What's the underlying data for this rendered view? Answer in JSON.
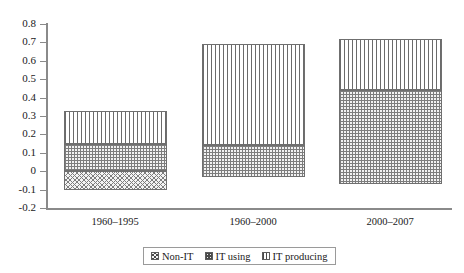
{
  "chart_data": {
    "type": "bar",
    "stacked": true,
    "title": "",
    "subtitle": "",
    "xlabel": "",
    "ylabel": "",
    "categories": [
      "1960–1995",
      "1960–2000",
      "2000–2007"
    ],
    "series": [
      {
        "name": "Non-IT",
        "values": [
          -0.1,
          -0.03,
          -0.07
        ],
        "pattern": "cross-hatch"
      },
      {
        "name": "IT using",
        "values": [
          0.25,
          0.175,
          0.51
        ],
        "pattern": "checkered-dots"
      },
      {
        "name": "IT producing",
        "values": [
          0.175,
          0.545,
          0.28
        ],
        "pattern": "vertical-lines"
      }
    ],
    "segment_bounds": [
      {
        "category": "1960–1995",
        "non_it": [
          -0.1,
          0.0
        ],
        "it_using": [
          0.0,
          0.15
        ],
        "it_producing": [
          0.15,
          0.325
        ]
      },
      {
        "category": "1960–2000",
        "non_it": [
          -0.03,
          0.0
        ],
        "it_using": [
          -0.03,
          0.145
        ],
        "it_producing": [
          0.145,
          0.69
        ]
      },
      {
        "category": "2000–2007",
        "non_it": [
          -0.07,
          0.0
        ],
        "it_using": [
          -0.07,
          0.44
        ],
        "it_producing": [
          0.44,
          0.72
        ]
      }
    ],
    "totals": [
      0.325,
      0.69,
      0.72
    ],
    "ylim": [
      -0.2,
      0.8
    ],
    "ytick_step": 0.1,
    "yticks": [
      "0.8",
      "0.7",
      "0.6",
      "0.5",
      "0.4",
      "0.3",
      "0.2",
      "0.1",
      "0",
      "-0.1",
      "-0.2"
    ],
    "ytick_values": [
      0.8,
      0.7,
      0.6,
      0.5,
      0.4,
      0.3,
      0.2,
      0.1,
      0.0,
      -0.1,
      -0.2
    ],
    "grid": false,
    "legend_position": "bottom-center",
    "legend": [
      "Non-IT",
      "IT using",
      "IT producing"
    ],
    "colors": {
      "axis": "#8a8a8a",
      "bar_border": "#6f6f6f",
      "hatch": "#7d7d7d",
      "text": "#1a1a1a",
      "background": "#ffffff"
    }
  },
  "axis": {
    "ytick_labels": [
      "0.8",
      "0.7",
      "0.6",
      "0.5",
      "0.4",
      "0.3",
      "0.2",
      "0.1",
      "0",
      "-0.1",
      "-0.2"
    ],
    "xtick_labels": [
      "1960–1995",
      "1960–2000",
      "2000–2007"
    ]
  },
  "legend": {
    "items": [
      {
        "label": "Non-IT",
        "pattern": "cross-hatch"
      },
      {
        "label": "IT using",
        "pattern": "checkered-dots"
      },
      {
        "label": "IT producing",
        "pattern": "vertical-lines"
      }
    ]
  }
}
